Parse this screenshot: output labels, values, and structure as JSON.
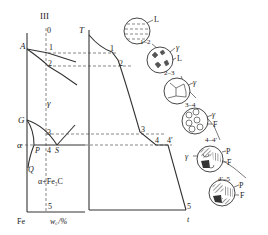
{
  "phase_diagram": {
    "alloy_label": "III",
    "points": {
      "A": "A",
      "G": "G",
      "P": "P",
      "Q": "Q",
      "S": "S"
    },
    "markers": [
      "0",
      "1",
      "2",
      "3",
      "4",
      "5"
    ],
    "regions": {
      "gamma": "γ",
      "alpha": "α",
      "alpha_fe3c": "α+Fe₃C"
    },
    "x_origin": "Fe",
    "x_axis": "w꜀/%"
  },
  "cooling_curve": {
    "y_axis": "T",
    "x_axis": "t",
    "points": [
      "1",
      "2",
      "3",
      "4",
      "4′",
      "5"
    ]
  },
  "microstructures": [
    {
      "stage": "1–2",
      "labels": [
        "L"
      ]
    },
    {
      "stage": "2–3",
      "labels": [
        "γ",
        "L"
      ]
    },
    {
      "stage": "3–4",
      "labels": [
        "γ"
      ]
    },
    {
      "stage": "4–4′",
      "labels": [
        "γ",
        "F"
      ]
    },
    {
      "stage": "4′–5",
      "labels": [
        "γ",
        "P",
        "F"
      ]
    },
    {
      "stage": "final",
      "labels": [
        "P",
        "F"
      ]
    }
  ]
}
